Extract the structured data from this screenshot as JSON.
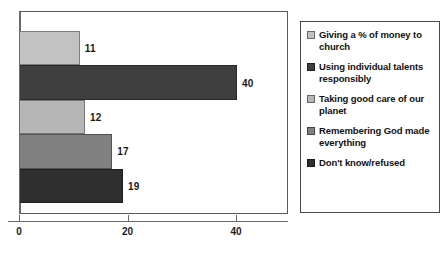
{
  "chart_data": {
    "type": "bar",
    "orientation": "horizontal",
    "title": "",
    "xlabel": "",
    "ylabel": "",
    "xlim": [
      0,
      49.5
    ],
    "grid": false,
    "legend_position": "right",
    "xticks": [
      {
        "value": 0,
        "label": "0"
      },
      {
        "value": 20,
        "label": "20"
      },
      {
        "value": 40,
        "label": "40"
      }
    ],
    "categories": [
      "Giving a % of money to church",
      "Using individual talents responsibly",
      "Taking good care of our planet",
      "Remembering God made everything",
      "Don't know/refused"
    ],
    "values": [
      11,
      40,
      12,
      17,
      19
    ],
    "value_labels": [
      "11",
      "40",
      "12",
      "17",
      "19"
    ],
    "colors": [
      "#c2c2c2",
      "#3f3f3f",
      "#b6b6b6",
      "#808080",
      "#2f2f2f"
    ]
  },
  "legend": {
    "items": [
      {
        "label": "Giving a % of money to church",
        "color": "#c2c2c2"
      },
      {
        "label": "Using individual talents responsibly",
        "color": "#3f3f3f"
      },
      {
        "label": "Taking good care of our planet",
        "color": "#b6b6b6"
      },
      {
        "label": "Remembering God made everything",
        "color": "#808080"
      },
      {
        "label": "Don't know/refused",
        "color": "#2f2f2f"
      }
    ]
  }
}
